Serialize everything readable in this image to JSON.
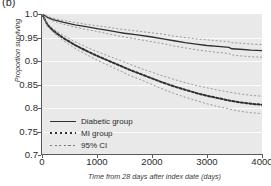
{
  "panel": {
    "label": "(b)"
  },
  "chart_data": {
    "type": "line",
    "title": "",
    "subtitle": "",
    "xlabel": "Time from 28 days after index date (days)",
    "ylabel": "Proportion surviving",
    "xlim": [
      0,
      4000
    ],
    "ylim": [
      0.7,
      1.0
    ],
    "xticks": [
      0,
      1000,
      2000,
      3000,
      4000
    ],
    "xticklabels": [
      "0",
      "1000",
      "2000",
      "3000",
      "4000"
    ],
    "yticks": [
      0.7,
      0.75,
      0.8,
      0.85,
      0.9,
      0.95,
      1.0
    ],
    "yticklabels": [
      "0.7",
      "0.75",
      "0.8",
      "0.85",
      "0.9",
      "0.95",
      "1.0"
    ],
    "grid": true,
    "grid_axis": "y",
    "grid_color": "#fbfbfb",
    "plot_background": "#e9e9e9",
    "legend_position": "lower left",
    "legend": [
      {
        "label": "Diabetic group",
        "style": "solid",
        "key": "legend-key-solid"
      },
      {
        "label": "MI group",
        "style": "dotted",
        "key": "legend-key-dotted"
      },
      {
        "label": "95% CI",
        "style": "fine-dash",
        "key": "legend-key-ci"
      }
    ],
    "series": [
      {
        "name": "Diabetic group",
        "style": "solid",
        "color": "#2f2f2f",
        "x": [
          0,
          100,
          200,
          400,
          600,
          800,
          1000,
          1200,
          1400,
          1500,
          1700,
          2000,
          2200,
          2400,
          2600,
          2800,
          3000,
          3200,
          3400,
          3450,
          3600,
          3800,
          4000
        ],
        "values": [
          1.0,
          0.993,
          0.988,
          0.982,
          0.977,
          0.973,
          0.969,
          0.965,
          0.961,
          0.959,
          0.956,
          0.951,
          0.947,
          0.943,
          0.939,
          0.936,
          0.933,
          0.931,
          0.929,
          0.926,
          0.925,
          0.923,
          0.922
        ]
      },
      {
        "name": "Diabetic group 95% CI upper",
        "style": "fine-dash",
        "color": "#8a8a8a",
        "x": [
          0,
          100,
          200,
          400,
          600,
          800,
          1000,
          1200,
          1400,
          1500,
          1700,
          2000,
          2200,
          2400,
          2600,
          2800,
          3000,
          3200,
          3400,
          3450,
          3600,
          3800,
          4000
        ],
        "values": [
          1.0,
          0.995,
          0.991,
          0.986,
          0.982,
          0.978,
          0.975,
          0.972,
          0.968,
          0.967,
          0.964,
          0.96,
          0.957,
          0.953,
          0.95,
          0.947,
          0.945,
          0.943,
          0.941,
          0.939,
          0.938,
          0.936,
          0.935
        ]
      },
      {
        "name": "Diabetic group 95% CI lower",
        "style": "fine-dash",
        "color": "#8a8a8a",
        "x": [
          0,
          100,
          200,
          400,
          600,
          800,
          1000,
          1200,
          1400,
          1500,
          1700,
          2000,
          2200,
          2400,
          2600,
          2800,
          3000,
          3200,
          3400,
          3450,
          3600,
          3800,
          4000
        ],
        "values": [
          1.0,
          0.991,
          0.985,
          0.978,
          0.972,
          0.967,
          0.963,
          0.958,
          0.953,
          0.951,
          0.947,
          0.941,
          0.937,
          0.932,
          0.928,
          0.924,
          0.921,
          0.918,
          0.916,
          0.913,
          0.911,
          0.909,
          0.908
        ]
      },
      {
        "name": "MI group",
        "style": "dotted",
        "color": "#2f2f2f",
        "x": [
          0,
          100,
          200,
          300,
          400,
          600,
          800,
          1000,
          1200,
          1400,
          1600,
          1800,
          2000,
          2200,
          2400,
          2600,
          2800,
          3000,
          3200,
          3400,
          3600,
          3800,
          4000
        ],
        "values": [
          1.0,
          0.977,
          0.965,
          0.956,
          0.948,
          0.934,
          0.922,
          0.911,
          0.901,
          0.891,
          0.881,
          0.872,
          0.863,
          0.854,
          0.846,
          0.839,
          0.832,
          0.826,
          0.821,
          0.816,
          0.812,
          0.809,
          0.807
        ]
      },
      {
        "name": "MI group 95% CI upper",
        "style": "fine-dash",
        "color": "#8a8a8a",
        "x": [
          0,
          100,
          200,
          300,
          400,
          600,
          800,
          1000,
          1200,
          1400,
          1600,
          1800,
          2000,
          2200,
          2400,
          2600,
          2800,
          3000,
          3200,
          3400,
          3600,
          3800,
          4000
        ],
        "values": [
          1.0,
          0.98,
          0.969,
          0.961,
          0.954,
          0.941,
          0.93,
          0.92,
          0.911,
          0.902,
          0.893,
          0.884,
          0.876,
          0.868,
          0.861,
          0.854,
          0.848,
          0.843,
          0.838,
          0.834,
          0.83,
          0.827,
          0.825
        ]
      },
      {
        "name": "MI group 95% CI lower",
        "style": "fine-dash",
        "color": "#8a8a8a",
        "x": [
          0,
          100,
          200,
          300,
          400,
          600,
          800,
          1000,
          1200,
          1400,
          1600,
          1800,
          2000,
          2200,
          2400,
          2600,
          2800,
          3000,
          3200,
          3400,
          3600,
          3800,
          4000
        ],
        "values": [
          1.0,
          0.974,
          0.961,
          0.951,
          0.942,
          0.927,
          0.914,
          0.902,
          0.891,
          0.88,
          0.869,
          0.86,
          0.85,
          0.84,
          0.831,
          0.823,
          0.816,
          0.809,
          0.803,
          0.798,
          0.793,
          0.79,
          0.788
        ]
      }
    ]
  }
}
